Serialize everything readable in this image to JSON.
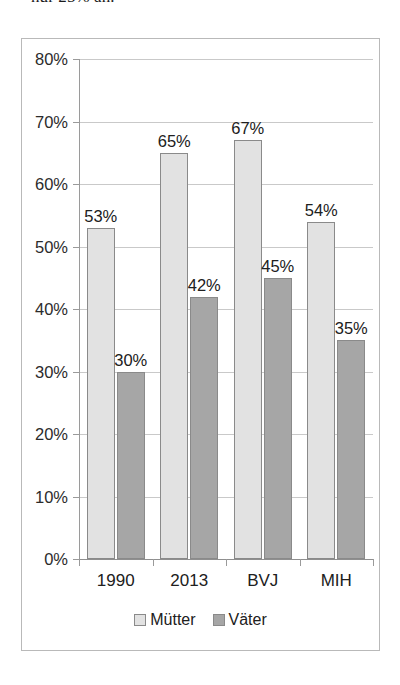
{
  "page": {
    "clipped_text_above_figure": "nur 25% an."
  },
  "chart_data": {
    "type": "bar",
    "title": "",
    "subtitle": "",
    "xlabel": "",
    "ylabel": "",
    "categories": [
      "1990",
      "2013",
      "BVJ",
      "MIH"
    ],
    "series": [
      {
        "name": "Mütter",
        "color": "#e2e2e2",
        "values": [
          53,
          65,
          67,
          54
        ],
        "labels": [
          "53%",
          "65%",
          "67%",
          "54%"
        ]
      },
      {
        "name": "Väter",
        "color": "#a6a6a6",
        "values": [
          30,
          42,
          45,
          35
        ],
        "labels": [
          "30%",
          "42%",
          "45%",
          "35%"
        ]
      }
    ],
    "ylim": [
      0,
      80
    ],
    "ytick_step": 10,
    "ytick_labels": [
      "80%",
      "70%",
      "60%",
      "50%",
      "40%",
      "30%",
      "20%",
      "10%",
      "0%"
    ],
    "ytick_values": [
      80,
      70,
      60,
      50,
      40,
      30,
      20,
      10,
      0
    ],
    "grid": true,
    "grid_axis": "y",
    "legend_position": "bottom",
    "value_labels": true,
    "unit": "%"
  }
}
